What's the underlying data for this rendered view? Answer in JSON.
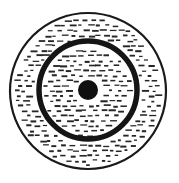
{
  "figure": {
    "background_color": "#ffffff",
    "ink_color": "#1a1a1a",
    "canvas": {
      "width": 179,
      "height": 183
    },
    "elements": {
      "outer_circle": {
        "name": "outer-circle",
        "cx": 88,
        "cy": 91,
        "r": 78,
        "stroke_width": 2.2,
        "stroke_color": "#1a1a1a",
        "fill": "hatch-dashes"
      },
      "inner_ring": {
        "name": "inner-ring",
        "cx": 88,
        "cy": 90,
        "r": 49,
        "stroke_width": 5.5,
        "stroke_color": "#151515",
        "fill": "none"
      },
      "center_dot": {
        "name": "center-dot",
        "cx": 88,
        "cy": 90,
        "r": 10,
        "fill_color": "#101010"
      },
      "hatch": {
        "name": "hatch-dash-fill",
        "style": "short horizontal dashes",
        "dash_color": "#262626",
        "dash_length": 5.2,
        "dash_thickness": 1.5,
        "row_spacing": 5.0,
        "column_spacing": 8.6,
        "row_offset": 4.3
      }
    }
  }
}
